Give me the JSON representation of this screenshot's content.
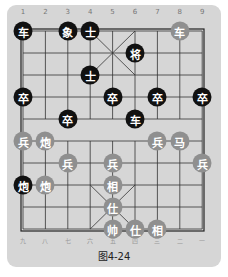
{
  "caption": "图4-24",
  "colors": {
    "panel": "#d6d6d6",
    "black_piece": "#111111",
    "red_piece": "#8f8f8f",
    "grid": "#333333"
  },
  "top_labels": [
    "1",
    "2",
    "3",
    "4",
    "5",
    "6",
    "7",
    "8",
    "9"
  ],
  "bottom_labels": [
    "九",
    "八",
    "七",
    "六",
    "五",
    "四",
    "三",
    "二",
    "一"
  ],
  "pieces": [
    {
      "char": "车",
      "side": "black",
      "col": 0,
      "row": 0
    },
    {
      "char": "象",
      "side": "black",
      "col": 2,
      "row": 0
    },
    {
      "char": "士",
      "side": "black",
      "col": 3,
      "row": 0
    },
    {
      "char": "车",
      "side": "red",
      "col": 7,
      "row": 0
    },
    {
      "char": "将",
      "side": "black",
      "col": 5,
      "row": 1
    },
    {
      "char": "士",
      "side": "black",
      "col": 3,
      "row": 2
    },
    {
      "char": "卒",
      "side": "black",
      "col": 0,
      "row": 3
    },
    {
      "char": "卒",
      "side": "black",
      "col": 4,
      "row": 3
    },
    {
      "char": "卒",
      "side": "black",
      "col": 6,
      "row": 3
    },
    {
      "char": "卒",
      "side": "black",
      "col": 8,
      "row": 3
    },
    {
      "char": "卒",
      "side": "black",
      "col": 2,
      "row": 4
    },
    {
      "char": "车",
      "side": "black",
      "col": 5,
      "row": 4
    },
    {
      "char": "兵",
      "side": "red",
      "col": 0,
      "row": 5
    },
    {
      "char": "炮",
      "side": "red",
      "col": 1,
      "row": 5
    },
    {
      "char": "兵",
      "side": "red",
      "col": 6,
      "row": 5
    },
    {
      "char": "马",
      "side": "red",
      "col": 7,
      "row": 5
    },
    {
      "char": "兵",
      "side": "red",
      "col": 2,
      "row": 6
    },
    {
      "char": "兵",
      "side": "red",
      "col": 4,
      "row": 6
    },
    {
      "char": "兵",
      "side": "red",
      "col": 8,
      "row": 6
    },
    {
      "char": "炮",
      "side": "black",
      "col": 0,
      "row": 7
    },
    {
      "char": "炮",
      "side": "red",
      "col": 1,
      "row": 7
    },
    {
      "char": "相",
      "side": "red",
      "col": 4,
      "row": 7
    },
    {
      "char": "仕",
      "side": "red",
      "col": 4,
      "row": 8
    },
    {
      "char": "帅",
      "side": "red",
      "col": 4,
      "row": 9
    },
    {
      "char": "仕",
      "side": "red",
      "col": 5,
      "row": 9
    },
    {
      "char": "相",
      "side": "red",
      "col": 6,
      "row": 9
    }
  ]
}
